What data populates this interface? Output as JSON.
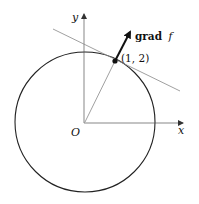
{
  "diagram": {
    "axes": {
      "x_label": "x",
      "y_label": "y",
      "origin_label": "O"
    },
    "point": {
      "label": "(1, 2)",
      "coords": [
        1,
        2
      ]
    },
    "gradient": {
      "label_bold": "grad",
      "label_italic": "f"
    },
    "elements": [
      "circle centered at origin",
      "tangent line at (1,2)",
      "radius to (1,2)",
      "gradient vector at (1,2)"
    ]
  }
}
